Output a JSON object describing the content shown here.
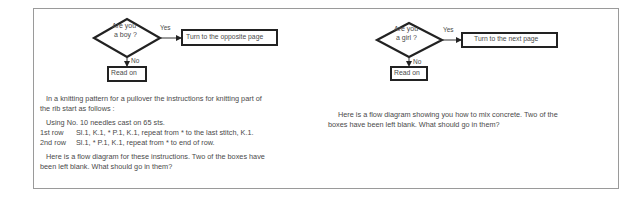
{
  "left_panel": {
    "flowchart": {
      "decision": {
        "line1": "Are you",
        "line2": "a boy ?"
      },
      "yes_label": "Yes",
      "no_label": "No",
      "yes_box": "Turn to the opposite page",
      "no_box": "Read on"
    },
    "intro_line1": "In a knitting pattern for a pullover the instructions for knitting part of",
    "intro_line2": "the rib start as follows :",
    "pattern": {
      "cast_on": "Using No. 10 needles cast on 65 sts.",
      "rows": [
        {
          "label": "1st row",
          "text": "Sl.1, K.1, * P.1, K.1, repeat from * to the last stitch, K.1."
        },
        {
          "label": "2nd row",
          "text": "Sl.1, * P.1, K.1, repeat from * to end of row."
        }
      ]
    },
    "question_line1": "Here is a flow diagram for these instructions. Two of the boxes have",
    "question_line2": "been left blank. What should go in them?"
  },
  "right_panel": {
    "flowchart": {
      "decision": {
        "line1": "Are you",
        "line2": "a girl ?"
      },
      "yes_label": "Yes",
      "no_label": "No",
      "yes_box": "Turn to the next page",
      "no_box": "Read on"
    },
    "question_line1": "Here is a flow diagram showing you how to mix concrete. Two of the",
    "question_line2": "boxes have been left blank. What should go in them?"
  }
}
